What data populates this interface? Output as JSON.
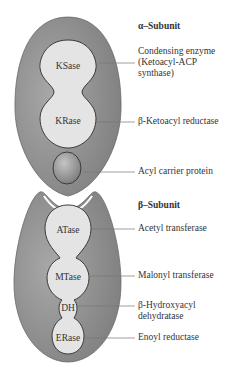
{
  "colors": {
    "subunit_fill": "#8f8f8f",
    "domain_fill": "#e4e4e4",
    "domain_stroke": "#3a3a3a",
    "acp_fill": "#9c9c9c",
    "text": "#333333",
    "leader": "#777777"
  },
  "alpha": {
    "title_symbol": "α",
    "title": "α–Subunit",
    "domains": [
      {
        "abbr": "KSase",
        "label": "Condensing enzyme (Ketoacyl-ACP synthase)",
        "label_lines": [
          "Condensing enzyme",
          "(Ketoacyl-ACP",
          "synthase)"
        ]
      },
      {
        "abbr": "KRase",
        "label": "β-Ketoacyl reductase",
        "label_lines": [
          "β-Ketoacyl reductase"
        ]
      }
    ]
  },
  "acp": {
    "label": "Acyl carrier protein"
  },
  "beta": {
    "title": "β–Subunit",
    "domains": [
      {
        "abbr": "ATase",
        "label_lines": [
          "Acetyl transferase"
        ]
      },
      {
        "abbr": "MTase",
        "label_lines": [
          "Malonyl transferase"
        ]
      },
      {
        "abbr": "DH",
        "label_lines": [
          "β-Hydroxyacyl",
          "dehydratase"
        ]
      },
      {
        "abbr": "ERase",
        "label_lines": [
          "Enoyl reductase"
        ]
      }
    ]
  }
}
